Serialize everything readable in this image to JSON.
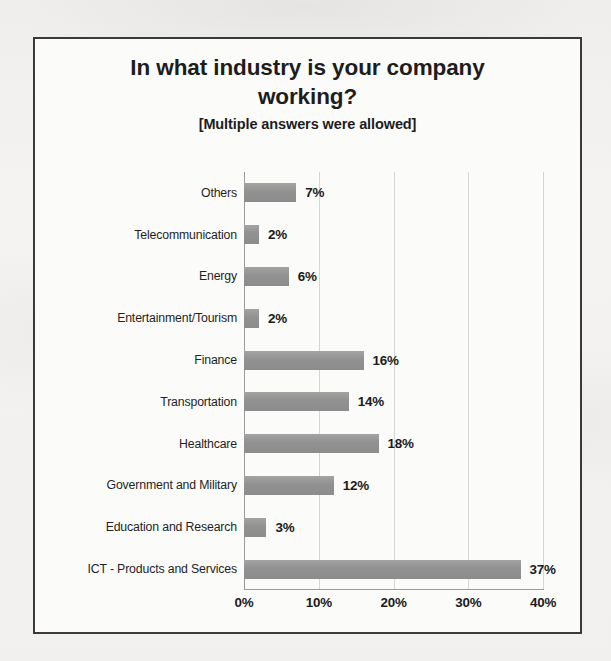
{
  "chart_data": {
    "type": "bar",
    "orientation": "horizontal",
    "title": "In what industry is your company working?",
    "title_lines": [
      "In what industry is your company",
      "working?"
    ],
    "subtitle": "[Multiple answers were allowed]",
    "xlabel": "",
    "ylabel": "",
    "xlim": [
      0,
      40
    ],
    "grid": true,
    "legend": false,
    "bar_color": "#919191",
    "xtick_labels": [
      "0%",
      "10%",
      "20%",
      "30%",
      "40%"
    ],
    "xticks": [
      0,
      10,
      20,
      30,
      40
    ],
    "categories": [
      "Others",
      "Telecommunication",
      "Energy",
      "Entertainment/Tourism",
      "Finance",
      "Transportation",
      "Healthcare",
      "Government and Military",
      "Education and Research",
      "ICT - Products and Services"
    ],
    "values": [
      7,
      2,
      6,
      2,
      16,
      14,
      18,
      12,
      3,
      37
    ],
    "value_labels": [
      "7%",
      "2%",
      "6%",
      "2%",
      "16%",
      "14%",
      "18%",
      "12%",
      "3%",
      "37%"
    ]
  }
}
